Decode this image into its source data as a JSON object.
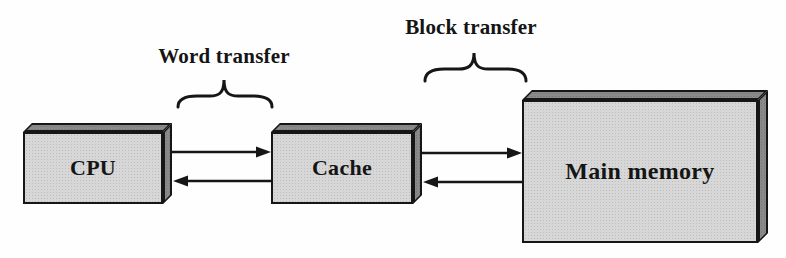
{
  "labels": {
    "word_transfer": "Word transfer",
    "block_transfer": "Block transfer"
  },
  "boxes": {
    "cpu": {
      "label": "CPU"
    },
    "cache": {
      "label": "Cache"
    },
    "main_memory": {
      "label": "Main memory"
    }
  },
  "arrows": [
    {
      "name": "cpu-to-cache",
      "direction": "right",
      "between": [
        "CPU",
        "Cache"
      ],
      "meaning": "word transfer"
    },
    {
      "name": "cache-to-cpu",
      "direction": "left",
      "between": [
        "Cache",
        "CPU"
      ],
      "meaning": "word transfer"
    },
    {
      "name": "cache-to-memory",
      "direction": "right",
      "between": [
        "Cache",
        "Main memory"
      ],
      "meaning": "block transfer"
    },
    {
      "name": "memory-to-cache",
      "direction": "left",
      "between": [
        "Main memory",
        "Cache"
      ],
      "meaning": "block transfer"
    }
  ],
  "colors": {
    "background": "#fefefe",
    "box_front_face": "#d7d7d7",
    "box_shaded_face": "#8e8e8e",
    "outline": "#161616",
    "text": "#151515"
  }
}
